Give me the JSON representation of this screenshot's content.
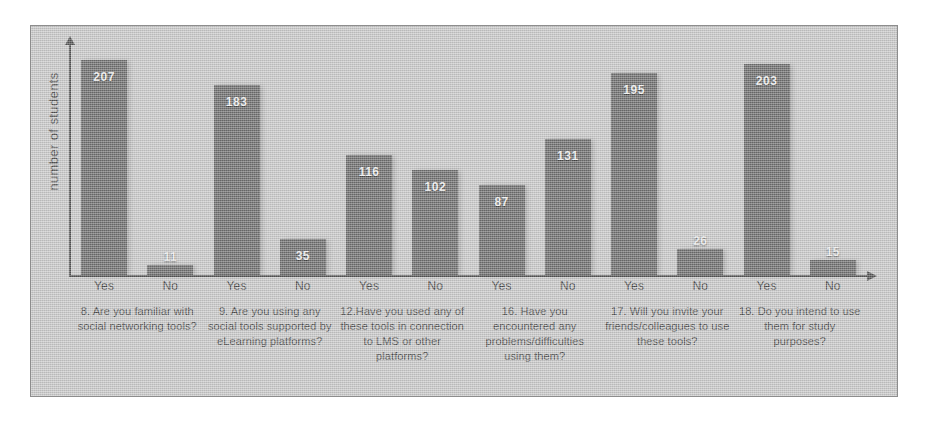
{
  "chart_data": {
    "type": "bar",
    "title": "",
    "subtitle": "",
    "xlabel": "",
    "ylabel": "number of students",
    "ylim": [
      0,
      230
    ],
    "grid": false,
    "legend": null,
    "legend_position": "none",
    "axis_arrows": true,
    "categories": [
      "8. Are you familiar with social networking tools?",
      "9. Are you using any social tools supported by eLearning platforms?",
      "12.Have you used any of these tools in connection to LMS or other platforms?",
      "16. Have you encountered any problems/difficulties using them?",
      "17. Will you invite your friends/colleagues to use these tools?",
      "18. Do you intend to use them for study purposes?"
    ],
    "tick_labels": [
      "Yes",
      "No",
      "Yes",
      "No",
      "Yes",
      "No",
      "Yes",
      "No",
      "Yes",
      "No",
      "Yes",
      "No"
    ],
    "series": [
      {
        "name": "Yes",
        "values": [
          207,
          183,
          116,
          87,
          195,
          203
        ]
      },
      {
        "name": "No",
        "values": [
          11,
          35,
          102,
          131,
          26,
          15
        ]
      }
    ],
    "values_flat": [
      207,
      11,
      183,
      35,
      116,
      102,
      87,
      131,
      195,
      26,
      203,
      15
    ],
    "colors": {
      "bar": "#6e6e6e",
      "background": "#c9c9c9",
      "axis": "#545454",
      "value_label": "#f2f2f2",
      "caption_text": "#4d4d4d",
      "border": "#8d8d8d"
    }
  },
  "groups": [
    {
      "caption": "8. Are you familiar with social networking tools?",
      "bars": [
        {
          "tick": "Yes",
          "value": 207,
          "label": "207"
        },
        {
          "tick": "No",
          "value": 11,
          "label": "11"
        }
      ]
    },
    {
      "caption": "9. Are you using any social tools supported by eLearning platforms?",
      "bars": [
        {
          "tick": "Yes",
          "value": 183,
          "label": "183"
        },
        {
          "tick": "No",
          "value": 35,
          "label": "35"
        }
      ]
    },
    {
      "caption": "12.Have you used any of these tools in connection to LMS or other platforms?",
      "bars": [
        {
          "tick": "Yes",
          "value": 116,
          "label": "116"
        },
        {
          "tick": "No",
          "value": 102,
          "label": "102"
        }
      ]
    },
    {
      "caption": "16. Have you encountered any problems/difficulties using them?",
      "bars": [
        {
          "tick": "Yes",
          "value": 87,
          "label": "87"
        },
        {
          "tick": "No",
          "value": 131,
          "label": "131"
        }
      ]
    },
    {
      "caption": "17. Will you invite your friends/colleagues to use these tools?",
      "bars": [
        {
          "tick": "Yes",
          "value": 195,
          "label": "195"
        },
        {
          "tick": "No",
          "value": 26,
          "label": "26"
        }
      ]
    },
    {
      "caption": "18. Do you intend to use them for study purposes?",
      "bars": [
        {
          "tick": "Yes",
          "value": 203,
          "label": "203"
        },
        {
          "tick": "No",
          "value": 15,
          "label": "15"
        }
      ]
    }
  ]
}
